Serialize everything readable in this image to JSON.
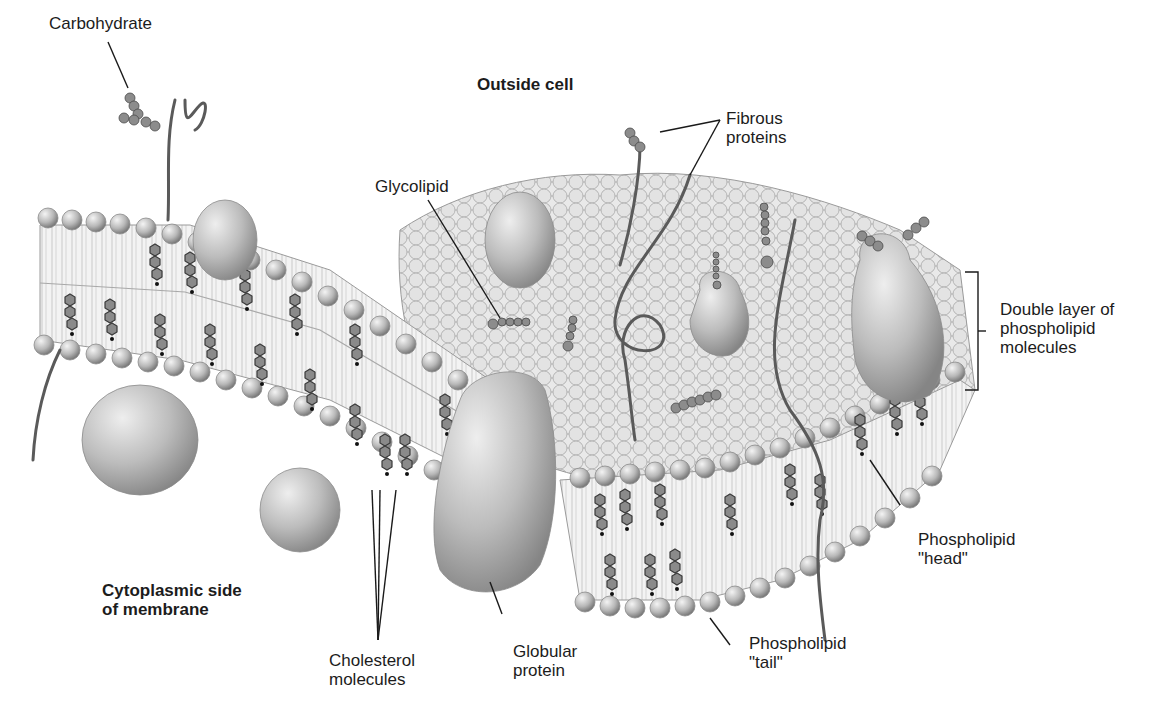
{
  "diagram": {
    "region_labels": {
      "outside": "Outside cell",
      "inside_line1": "Cytoplasmic side",
      "inside_line2": "of membrane"
    },
    "labels": {
      "carbohydrate": "Carbohydrate",
      "glycolipid": "Glycolipid",
      "fibrous_line1": "Fibrous",
      "fibrous_line2": "proteins",
      "double_layer_line1": "Double layer of",
      "double_layer_line2": "phospholipid",
      "double_layer_line3": "molecules",
      "head_line1": "Phospholipid",
      "head_line2": "\"head\"",
      "tail_line1": "Phospholipid",
      "tail_line2": "\"tail\"",
      "globular_line1": "Globular",
      "globular_line2": "protein",
      "cholesterol_line1": "Cholesterol",
      "cholesterol_line2": "molecules"
    },
    "colors": {
      "background": "#ffffff",
      "head_light": "#e6e6e6",
      "head_dark": "#8c8c8c",
      "tail": "#f2f2f2",
      "protein": "#bdbdbd",
      "cholesterol": "#6e6e6e",
      "leader_line": "#1a1a1a"
    }
  }
}
